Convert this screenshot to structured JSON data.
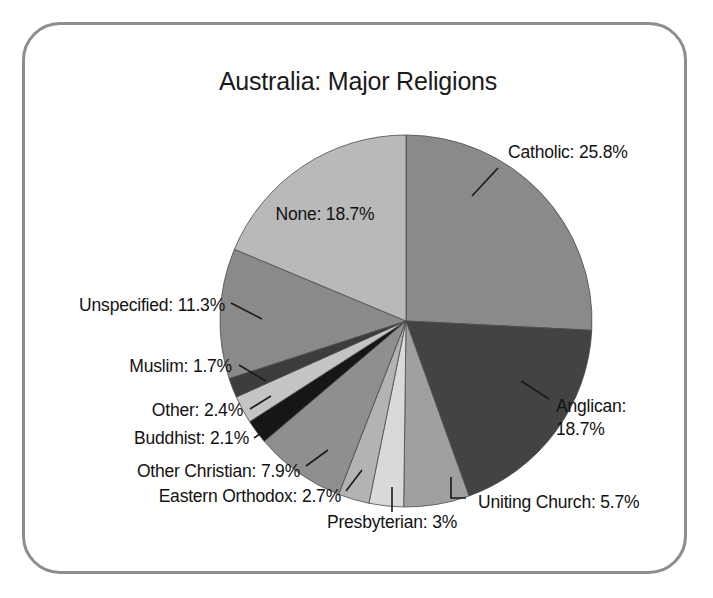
{
  "figure": {
    "title": "Australia: Major Religions",
    "border_color": "#8d8d8d",
    "background_color": "#ffffff"
  },
  "chart_data": {
    "type": "pie",
    "title": "Australia: Major Religions",
    "xlabel": "",
    "ylabel": "",
    "start_angle_deg": 90,
    "direction": "clockwise",
    "units": "percent",
    "legend": "none",
    "labels_inline": true,
    "categories": [
      "Catholic",
      "Anglican",
      "Uniting Church",
      "Presbyterian",
      "Eastern Orthodox",
      "Other Christian",
      "Buddhist",
      "Other",
      "Muslim",
      "Unspecified",
      "None"
    ],
    "values": [
      25.8,
      18.7,
      5.7,
      3.0,
      2.7,
      7.9,
      2.1,
      2.4,
      1.7,
      11.3,
      18.7
    ],
    "value_labels": [
      "25.8%",
      "18.7%",
      "5.7%",
      "3%",
      "2.7%",
      "7.9%",
      "2.1%",
      "2.4%",
      "1.7%",
      "11.3%",
      "18.7%"
    ],
    "slice_colors": [
      "#8a8a8a",
      "#434343",
      "#a0a0a0",
      "#d9d9d9",
      "#b3b3b3",
      "#8f8f8f",
      "#161616",
      "#c4c4c4",
      "#3c3c3c",
      "#8a8a8a",
      "#b9b9b9"
    ],
    "slices": [
      {
        "name": "Catholic",
        "value": 25.8,
        "label": "Catholic: 25.8%",
        "color": "#8a8a8a"
      },
      {
        "name": "Anglican",
        "value": 18.7,
        "label": "Anglican: 18.7%",
        "color": "#434343"
      },
      {
        "name": "Uniting Church",
        "value": 5.7,
        "label": "Uniting Church: 5.7%",
        "color": "#a0a0a0"
      },
      {
        "name": "Presbyterian",
        "value": 3.0,
        "label": "Presbyterian: 3%",
        "color": "#d9d9d9"
      },
      {
        "name": "Eastern Orthodox",
        "value": 2.7,
        "label": "Eastern Orthodox: 2.7%",
        "color": "#b3b3b3"
      },
      {
        "name": "Other Christian",
        "value": 7.9,
        "label": "Other Christian: 7.9%",
        "color": "#8f8f8f"
      },
      {
        "name": "Buddhist",
        "value": 2.1,
        "label": "Buddhist: 2.1%",
        "color": "#161616"
      },
      {
        "name": "Other",
        "value": 2.4,
        "label": "Other: 2.4%",
        "color": "#c4c4c4"
      },
      {
        "name": "Muslim",
        "value": 1.7,
        "label": "Muslim: 1.7%",
        "color": "#3c3c3c"
      },
      {
        "name": "Unspecified",
        "value": 11.3,
        "label": "Unspecified: 11.3%",
        "color": "#8a8a8a"
      },
      {
        "name": "None",
        "value": 18.7,
        "label": "None: 18.7%",
        "color": "#b9b9b9"
      }
    ]
  },
  "labels": [
    {
      "id": "catholic",
      "text": "Catholic: 25.8%",
      "lines": [
        "Catholic: 25.8%"
      ],
      "x": 508,
      "y": 158,
      "anchor": "start"
    },
    {
      "id": "anglican",
      "text": "Anglican: 18.7%",
      "lines": [
        "Anglican:",
        "18.7%"
      ],
      "x": 556,
      "y": 412,
      "anchor": "start"
    },
    {
      "id": "uniting-church",
      "text": "Uniting Church: 5.7%",
      "lines": [
        "Uniting Church: 5.7%"
      ],
      "x": 478,
      "y": 508,
      "anchor": "start"
    },
    {
      "id": "presbyterian",
      "text": "Presbyterian: 3%",
      "lines": [
        "Presbyterian: 3%"
      ],
      "x": 392,
      "y": 528,
      "anchor": "middle"
    },
    {
      "id": "eastern-orthodox",
      "text": "Eastern Orthodox: 2.7%",
      "lines": [
        "Eastern Orthodox: 2.7%"
      ],
      "x": 341,
      "y": 502,
      "anchor": "end"
    },
    {
      "id": "other-christian",
      "text": "Other Christian: 7.9%",
      "lines": [
        "Other Christian: 7.9%"
      ],
      "x": 300,
      "y": 477,
      "anchor": "end"
    },
    {
      "id": "buddhist",
      "text": "Buddhist: 2.1%",
      "lines": [
        "Buddhist: 2.1%"
      ],
      "x": 249,
      "y": 444,
      "anchor": "end"
    },
    {
      "id": "other",
      "text": "Other: 2.4%",
      "lines": [
        "Other: 2.4%"
      ],
      "x": 243,
      "y": 416,
      "anchor": "end"
    },
    {
      "id": "muslim",
      "text": "Muslim: 1.7%",
      "lines": [
        "Muslim: 1.7%"
      ],
      "x": 232,
      "y": 372,
      "anchor": "end"
    },
    {
      "id": "unspecified",
      "text": "Unspecified: 11.3%",
      "lines": [
        "Unspecified: 11.3%"
      ],
      "x": 225,
      "y": 311,
      "anchor": "end"
    },
    {
      "id": "none",
      "text": "None: 18.7%",
      "lines": [
        "None: 18.7%"
      ],
      "x": 325,
      "y": 220,
      "anchor": "middle"
    }
  ]
}
